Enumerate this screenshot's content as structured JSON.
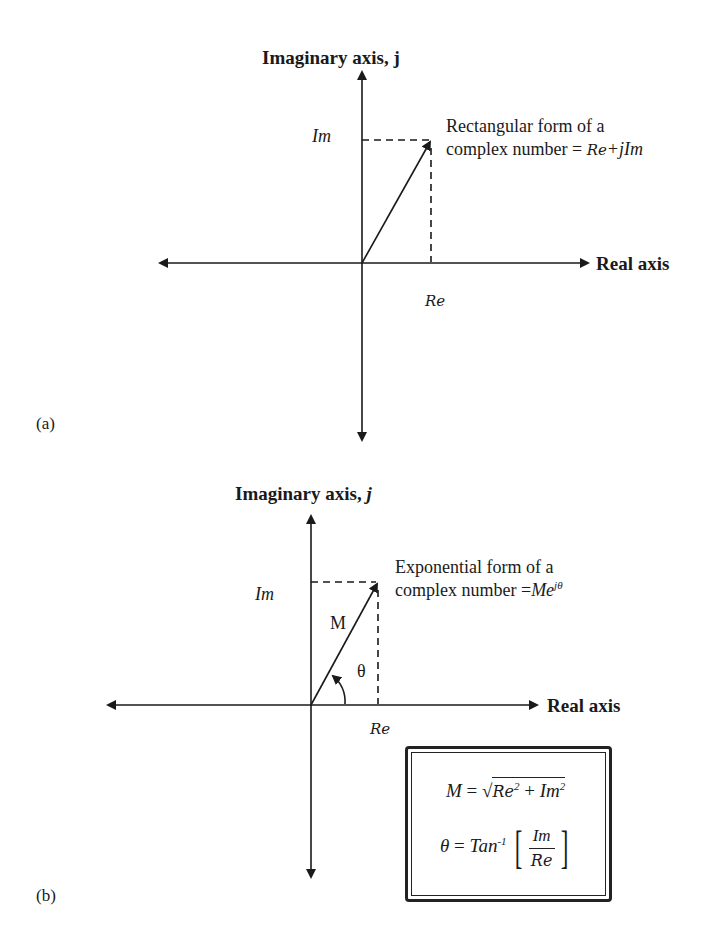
{
  "panels": [
    {
      "id": "a",
      "label": "(a)",
      "y_axis_title": "Imaginary axis, j",
      "x_axis_title": "Real axis",
      "im_label": "Im",
      "re_label": "Re",
      "description_line1": "Rectangular form of a",
      "description_line2": "complex number = ",
      "formula": "Re+jIm",
      "formula_parts": {
        "re": "Re",
        "plus_j": "+j",
        "im": "Im"
      }
    },
    {
      "id": "b",
      "label": "(b)",
      "y_axis_title": "Imaginary axis, ",
      "y_axis_symbol": "j",
      "x_axis_title": "Real axis",
      "im_label": "Im",
      "re_label": "Re",
      "magnitude_label": "M",
      "angle_label": "θ",
      "description_line1": "Exponential form of a",
      "description_line2": "complex number =",
      "formula": "Me^jθ",
      "formula_parts": {
        "base": "Me",
        "exponent": "jθ"
      }
    }
  ],
  "formula_box": {
    "magnitude": {
      "lhs": "M",
      "eq": "=",
      "re": "Re",
      "re_exp": "2",
      "plus": "+",
      "im": "Im",
      "im_exp": "2"
    },
    "angle": {
      "lhs": "θ",
      "eq": "=",
      "fn": "Tan",
      "fn_exp": "-1",
      "numerator": "Im",
      "denominator": "Re",
      "lbracket": "[",
      "rbracket": "]"
    }
  },
  "colors": {
    "ink": "#1a1a1a",
    "background": "#ffffff"
  }
}
